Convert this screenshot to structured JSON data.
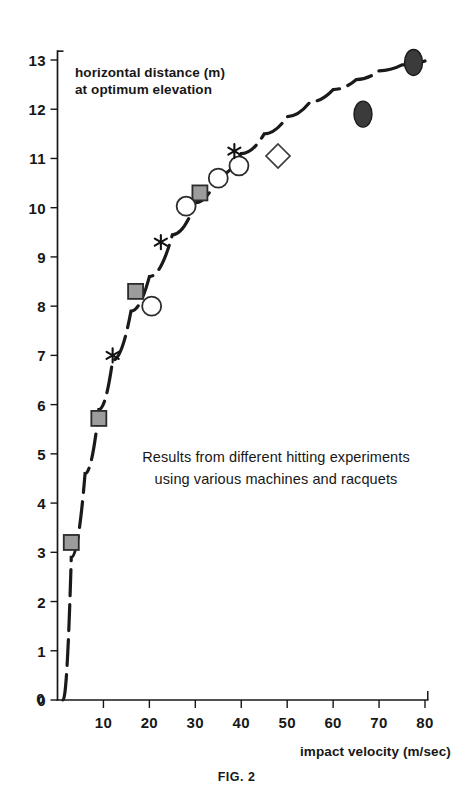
{
  "figure": {
    "caption": "FIG. 2",
    "annotation_line1": "Results from different hitting experiments",
    "annotation_line2": "using various machines and racquets",
    "ylabel_line1": "horizontal distance (m)",
    "ylabel_line2": "at optimum elevation",
    "xlabel": "impact velocity (m/sec)"
  },
  "colors": {
    "ink": "#171717",
    "curve": "#1a1a1a",
    "square_fill": "#9c9c9c",
    "square_stroke": "#2b2b2b",
    "circle_fill": "#ffffff",
    "circle_stroke": "#2b2b2b",
    "diamond_fill": "#ffffff",
    "diamond_stroke": "#3a3a3a",
    "ellipse_fill": "#3b3b3b",
    "ellipse_stroke": "#1a1a1a",
    "asterisk": "#111111"
  },
  "chart_data": {
    "type": "scatter",
    "title": "",
    "subtitle": "Results from different hitting experiments using various machines and racquets",
    "xlabel": "impact velocity (m/sec)",
    "ylabel": "horizontal distance (m) at optimum elevation",
    "xlim": [
      0,
      83
    ],
    "ylim": [
      0,
      13.4
    ],
    "xticks": [
      0,
      10,
      20,
      30,
      40,
      50,
      60,
      70,
      80
    ],
    "xtick_labels": [
      "0",
      "10",
      "20",
      "30",
      "40",
      "50",
      "60",
      "70",
      "80"
    ],
    "yticks": [
      0,
      1,
      2,
      3,
      4,
      5,
      6,
      7,
      8,
      9,
      10,
      11,
      12,
      13
    ],
    "ytick_labels": [
      "0",
      "1",
      "2",
      "3",
      "4",
      "5",
      "6",
      "7",
      "8",
      "9",
      "10",
      "11",
      "12",
      "13"
    ],
    "grid": false,
    "legend": "none",
    "series": [
      {
        "name": "filled-square",
        "marker": "square",
        "x": [
          3,
          9,
          17,
          31
        ],
        "y": [
          3.2,
          5.72,
          8.3,
          10.3
        ]
      },
      {
        "name": "open-circle",
        "marker": "circle",
        "x": [
          20.5,
          28,
          35,
          39.5
        ],
        "y": [
          8.0,
          10.03,
          10.6,
          10.85
        ]
      },
      {
        "name": "asterisk",
        "marker": "asterisk",
        "x": [
          12,
          22.5,
          38.5
        ],
        "y": [
          7.0,
          9.3,
          11.15
        ]
      },
      {
        "name": "open-diamond",
        "marker": "diamond",
        "x": [
          48
        ],
        "y": [
          11.05
        ]
      },
      {
        "name": "filled-ellipse",
        "marker": "ellipse",
        "x": [
          66.5,
          77.5
        ],
        "y": [
          11.9,
          12.95
        ]
      }
    ],
    "fit_curve": {
      "name": "dashed-trend-curve",
      "style": "dashed",
      "x": [
        1.2,
        3,
        6,
        9,
        12,
        16,
        20,
        25,
        30,
        35,
        40,
        45,
        50,
        55,
        60,
        65,
        70,
        75,
        80
      ],
      "y": [
        0.0,
        2.9,
        4.6,
        5.9,
        6.9,
        7.9,
        8.6,
        9.45,
        10.1,
        10.65,
        11.1,
        11.5,
        11.85,
        12.15,
        12.4,
        12.6,
        12.78,
        12.9,
        12.98
      ]
    }
  }
}
